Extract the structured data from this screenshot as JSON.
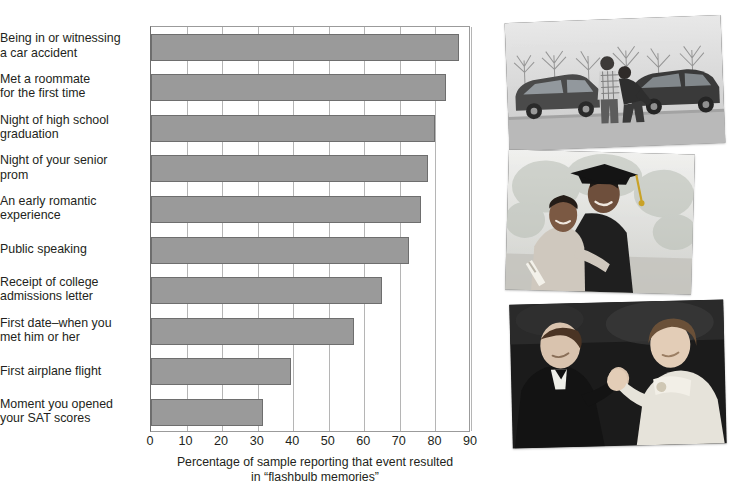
{
  "chart_data": {
    "type": "bar",
    "orientation": "horizontal",
    "title": "",
    "xlabel": "Percentage of sample reporting that event resulted in “flashbulb memories”",
    "ylabel": "",
    "xlim": [
      0,
      90
    ],
    "xticks": [
      0,
      10,
      20,
      30,
      40,
      50,
      60,
      70,
      80,
      90
    ],
    "grid": true,
    "legend": null,
    "bar_color": "#9a9a9a",
    "bar_edge_color": "#6e6e6e",
    "categories": [
      "Being in or witnessing a car accident",
      "Met a roommate for the first time",
      "Night of high school graduation",
      "Night of your senior prom",
      "An early romantic experience",
      "Public speaking",
      "Receipt of college admissions letter",
      "First date–when you met him or her",
      "First airplane flight",
      "Moment you opened your SAT scores"
    ],
    "values": [
      86.5,
      83,
      80,
      78,
      76,
      72.5,
      65,
      57,
      39.5,
      31.5
    ]
  },
  "chart": {
    "axis_caption_line1": "Percentage of sample reporting that event resulted",
    "axis_caption_line2": "in “flashbulb memories”",
    "y_labels": [
      {
        "line1": "Being in or witnessing",
        "line2": "a car accident"
      },
      {
        "line1": "Met a roommate",
        "line2": "for the first time"
      },
      {
        "line1": "Night of high school",
        "line2": "graduation"
      },
      {
        "line1": "Night of your senior",
        "line2": "prom"
      },
      {
        "line1": "An early romantic",
        "line2": "experience"
      },
      {
        "line1": "Public speaking",
        "line2": ""
      },
      {
        "line1": "Receipt of college",
        "line2": "admissions letter"
      },
      {
        "line1": "First date–when you",
        "line2": "met him or her"
      },
      {
        "line1": "First airplane flight",
        "line2": ""
      },
      {
        "line1": "Moment you opened",
        "line2": "your SAT scores"
      }
    ]
  },
  "photos": [
    {
      "name": "car-accident-photo",
      "caption": "Two people inspecting cars after a collision in a parking lot"
    },
    {
      "name": "graduation-photo",
      "caption": "Graduate in cap and gown with a woman holding a diploma"
    },
    {
      "name": "prom-dance-photo",
      "caption": "A young couple in formal wear dancing at a prom"
    }
  ]
}
